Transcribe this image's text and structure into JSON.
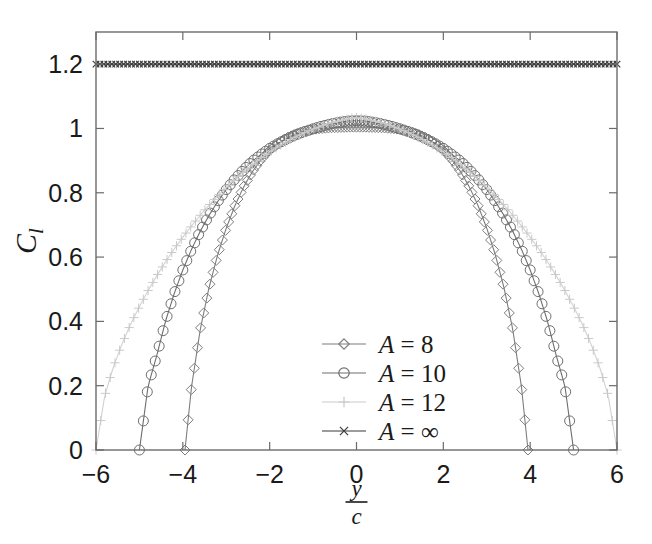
{
  "figure": {
    "background": "#ffffff",
    "axes_color": "#6b6b6b",
    "text_color": "#1a1a1a"
  },
  "chart_data": {
    "type": "line",
    "title": "",
    "subtitle": "",
    "xlabel": "y/c",
    "xlabel_numerator": "y",
    "xlabel_denominator": "c",
    "ylabel": "C_l",
    "ylabel_main": "C",
    "ylabel_sub": "l",
    "xlim": [
      -6,
      6
    ],
    "ylim": [
      0,
      1.3
    ],
    "xticks": [
      -6,
      -4,
      -2,
      0,
      2,
      4,
      6
    ],
    "xticklabels": [
      "-6",
      "-4",
      "-2",
      "0",
      "2",
      "4",
      "6"
    ],
    "yticks": [
      0,
      0.2,
      0.4,
      0.6,
      0.8,
      1,
      1.2
    ],
    "yticklabels": [
      "0",
      "0.2",
      "0.4",
      "0.6",
      "0.8",
      "1",
      "1.2"
    ],
    "grid": false,
    "legend_position": "center-right",
    "series": [
      {
        "name": "A = 8",
        "marker": "diamond",
        "color": "#7d7d7d",
        "line_color": "#7d7d7d",
        "half_span": 3.95,
        "peak": 1.005,
        "flat": 0.995,
        "x": [
          -3.95,
          -3.8,
          -3.6,
          -3.4,
          -3.2,
          -3.0,
          -2.8,
          -2.6,
          -2.4,
          -2.2,
          -2.0,
          -1.8,
          -1.6,
          -1.4,
          -1.2,
          -1.0,
          -0.8,
          -0.6,
          -0.4,
          -0.2,
          0.0,
          0.2,
          0.4,
          0.6,
          0.8,
          1.0,
          1.2,
          1.4,
          1.6,
          1.8,
          2.0,
          2.2,
          2.4,
          2.6,
          2.8,
          3.0,
          3.2,
          3.4,
          3.6,
          3.8,
          3.95
        ],
        "y": [
          0.0,
          0.196,
          0.374,
          0.503,
          0.606,
          0.69,
          0.76,
          0.818,
          0.865,
          0.903,
          0.932,
          0.954,
          0.971,
          0.983,
          0.991,
          0.997,
          1.0,
          1.002,
          1.003,
          1.004,
          1.004,
          1.004,
          1.003,
          1.002,
          1.0,
          0.997,
          0.991,
          0.983,
          0.971,
          0.954,
          0.932,
          0.903,
          0.865,
          0.818,
          0.76,
          0.69,
          0.606,
          0.503,
          0.374,
          0.196,
          0.0
        ]
      },
      {
        "name": "A = 10",
        "marker": "circle",
        "color": "#6e6e6e",
        "line_color": "#6e6e6e",
        "half_span": 5.0,
        "peak": 1.045,
        "flat": 1.04,
        "x": [
          -5.0,
          -4.8,
          -4.6,
          -4.4,
          -4.2,
          -4.0,
          -3.8,
          -3.6,
          -3.4,
          -3.2,
          -3.0,
          -2.8,
          -2.6,
          -2.4,
          -2.2,
          -2.0,
          -1.8,
          -1.6,
          -1.4,
          -1.2,
          -1.0,
          -0.8,
          -0.6,
          -0.4,
          -0.2,
          0.0,
          0.2,
          0.4,
          0.6,
          0.8,
          1.0,
          1.2,
          1.4,
          1.6,
          1.8,
          2.0,
          2.2,
          2.4,
          2.6,
          2.8,
          3.0,
          3.2,
          3.4,
          3.6,
          3.8,
          4.0,
          4.2,
          4.4,
          4.6,
          4.8,
          5.0
        ],
        "y": [
          0.0,
          0.199,
          0.294,
          0.4,
          0.486,
          0.56,
          0.624,
          0.68,
          0.729,
          0.772,
          0.81,
          0.843,
          0.872,
          0.898,
          0.919,
          0.938,
          0.954,
          0.968,
          0.98,
          0.99,
          0.999,
          1.007,
          1.014,
          1.019,
          1.023,
          1.024,
          1.023,
          1.019,
          1.014,
          1.007,
          0.999,
          0.99,
          0.98,
          0.968,
          0.954,
          0.938,
          0.919,
          0.898,
          0.872,
          0.843,
          0.81,
          0.772,
          0.729,
          0.68,
          0.624,
          0.56,
          0.486,
          0.4,
          0.294,
          0.199,
          0.0
        ]
      },
      {
        "name": "A = 12",
        "marker": "plus",
        "color": "#c9c9c9",
        "line_color": "#d2d2d2",
        "half_span": 6.0,
        "peak": 1.09,
        "flat": 1.085,
        "x": [
          -6.0,
          -5.8,
          -5.6,
          -5.4,
          -5.2,
          -5.0,
          -4.8,
          -4.6,
          -4.4,
          -4.2,
          -4.0,
          -3.8,
          -3.6,
          -3.4,
          -3.2,
          -3.0,
          -2.8,
          -2.6,
          -2.4,
          -2.2,
          -2.0,
          -1.8,
          -1.6,
          -1.4,
          -1.2,
          -1.0,
          -0.8,
          -0.6,
          -0.4,
          -0.2,
          0.0,
          0.2,
          0.4,
          0.6,
          0.8,
          1.0,
          1.2,
          1.4,
          1.6,
          1.8,
          2.0,
          2.2,
          2.4,
          2.6,
          2.8,
          3.0,
          3.2,
          3.4,
          3.6,
          3.8,
          4.0,
          4.2,
          4.4,
          4.6,
          4.8,
          5.0,
          5.2,
          5.4,
          5.6,
          5.8,
          6.0
        ],
        "y": [
          0.0,
          0.168,
          0.258,
          0.33,
          0.392,
          0.446,
          0.496,
          0.542,
          0.585,
          0.625,
          0.662,
          0.697,
          0.73,
          0.761,
          0.79,
          0.817,
          0.842,
          0.866,
          0.888,
          0.908,
          0.927,
          0.944,
          0.96,
          0.974,
          0.987,
          0.998,
          1.008,
          1.017,
          1.024,
          1.03,
          1.034,
          1.03,
          1.024,
          1.017,
          1.008,
          0.998,
          0.987,
          0.974,
          0.96,
          0.944,
          0.927,
          0.908,
          0.888,
          0.866,
          0.842,
          0.817,
          0.79,
          0.761,
          0.73,
          0.697,
          0.662,
          0.625,
          0.585,
          0.542,
          0.496,
          0.446,
          0.392,
          0.33,
          0.258,
          0.168,
          0.0
        ]
      },
      {
        "name": "A = ∞",
        "marker": "x",
        "color": "#3a3a3a",
        "line_color": "#3a3a3a",
        "half_span": 6.0,
        "peak": 1.2,
        "flat": 1.2,
        "constant": 1.2,
        "x": [
          -6.0,
          6.0
        ],
        "y": [
          1.2,
          1.2
        ]
      }
    ]
  },
  "legend": {
    "entries": [
      {
        "label": "A = 8",
        "marker": "diamond",
        "color": "#7d7d7d"
      },
      {
        "label": "A = 10",
        "marker": "circle",
        "color": "#6e6e6e"
      },
      {
        "label": "A = 12",
        "marker": "plus",
        "color": "#c9c9c9"
      },
      {
        "label": "A = ∞",
        "marker": "x",
        "color": "#3a3a3a"
      }
    ]
  }
}
